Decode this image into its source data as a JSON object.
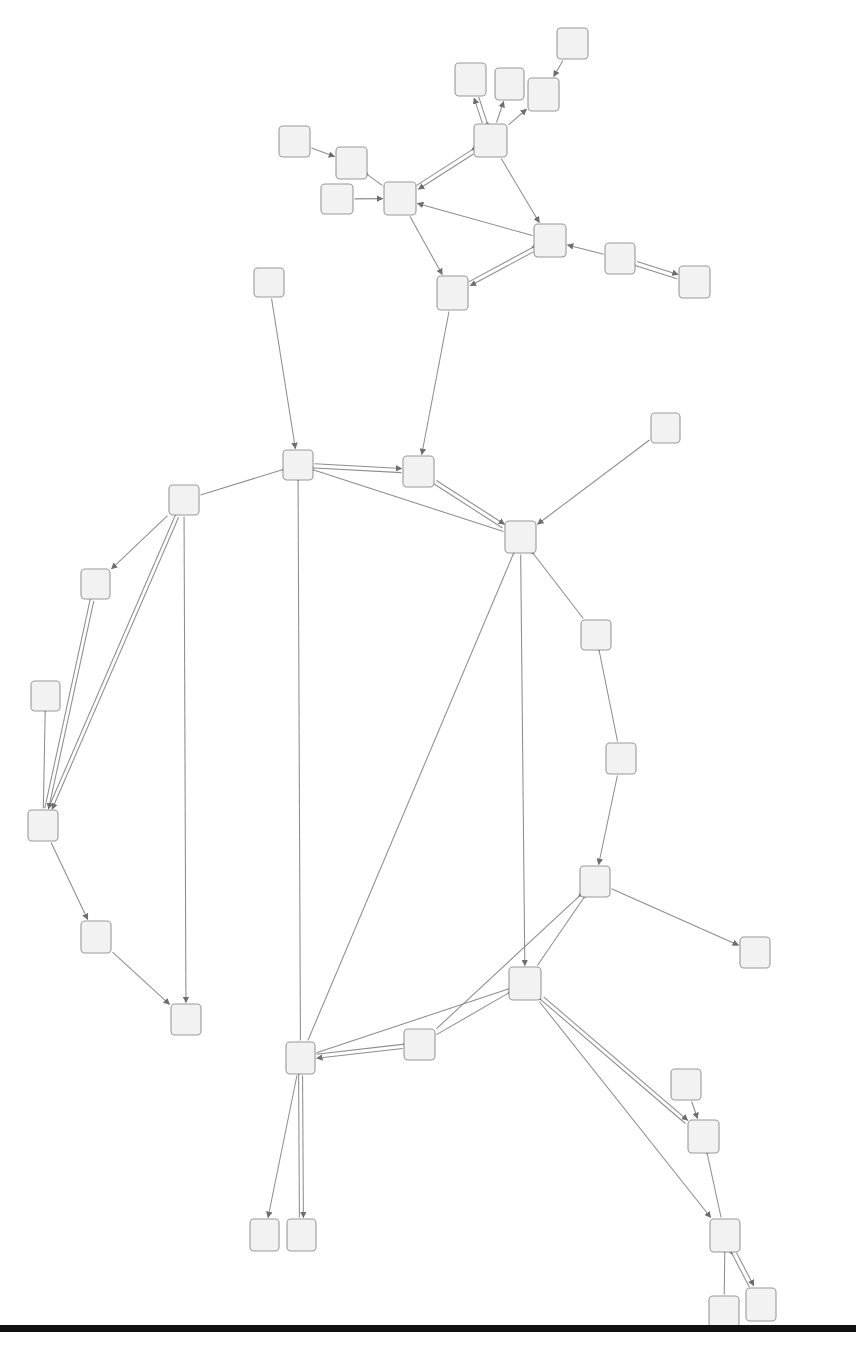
{
  "figure": {
    "kind": "directed-graph-diagram",
    "title": "",
    "caption": "",
    "width": 856,
    "height": 1356,
    "background_color": "#ffffff"
  },
  "style": {
    "node_fill": "#f2f2f2",
    "node_stroke": "#9a9a9a",
    "node_stroke_width": 1.1,
    "node_corner_radius": 4,
    "edge_color": "#8d8d8d",
    "edge_width": 1.05,
    "arrowhead_color": "#6e6e6e",
    "baseline_color": "#111111"
  },
  "baseline": {
    "label": "page-rule",
    "x": 0,
    "y": 1325,
    "width": 856,
    "height": 7
  },
  "graph_data": {
    "type": "node-link",
    "directed": true,
    "node_count": 41,
    "edge_count": 52,
    "node_label_text": "",
    "nodes": [
      {
        "id": "n1",
        "x": 557,
        "y": 28,
        "w": 31,
        "h": 31
      },
      {
        "id": "n2",
        "x": 455,
        "y": 63,
        "w": 31,
        "h": 33
      },
      {
        "id": "n3",
        "x": 495,
        "y": 68,
        "w": 29,
        "h": 32
      },
      {
        "id": "n4",
        "x": 528,
        "y": 78,
        "w": 31,
        "h": 33
      },
      {
        "id": "n5",
        "x": 474,
        "y": 124,
        "w": 33,
        "h": 33
      },
      {
        "id": "n6",
        "x": 279,
        "y": 126,
        "w": 31,
        "h": 31
      },
      {
        "id": "n7",
        "x": 336,
        "y": 147,
        "w": 31,
        "h": 32
      },
      {
        "id": "n8",
        "x": 321,
        "y": 184,
        "w": 32,
        "h": 30
      },
      {
        "id": "n9",
        "x": 384,
        "y": 182,
        "w": 32,
        "h": 33
      },
      {
        "id": "n10",
        "x": 534,
        "y": 224,
        "w": 32,
        "h": 33
      },
      {
        "id": "n11",
        "x": 605,
        "y": 243,
        "w": 30,
        "h": 31
      },
      {
        "id": "n12",
        "x": 679,
        "y": 266,
        "w": 31,
        "h": 32
      },
      {
        "id": "n13",
        "x": 437,
        "y": 276,
        "w": 31,
        "h": 34
      },
      {
        "id": "n14",
        "x": 254,
        "y": 268,
        "w": 30,
        "h": 29
      },
      {
        "id": "n15",
        "x": 651,
        "y": 413,
        "w": 29,
        "h": 30
      },
      {
        "id": "n16",
        "x": 283,
        "y": 450,
        "w": 30,
        "h": 30
      },
      {
        "id": "n17",
        "x": 403,
        "y": 456,
        "w": 31,
        "h": 31
      },
      {
        "id": "n18",
        "x": 169,
        "y": 485,
        "w": 30,
        "h": 30
      },
      {
        "id": "n19",
        "x": 505,
        "y": 521,
        "w": 31,
        "h": 32
      },
      {
        "id": "n20",
        "x": 81,
        "y": 569,
        "w": 29,
        "h": 30
      },
      {
        "id": "n21",
        "x": 581,
        "y": 620,
        "w": 30,
        "h": 30
      },
      {
        "id": "n22",
        "x": 31,
        "y": 681,
        "w": 29,
        "h": 30
      },
      {
        "id": "n23",
        "x": 606,
        "y": 743,
        "w": 30,
        "h": 31
      },
      {
        "id": "n24",
        "x": 28,
        "y": 810,
        "w": 30,
        "h": 31
      },
      {
        "id": "n25",
        "x": 580,
        "y": 866,
        "w": 30,
        "h": 31
      },
      {
        "id": "n26",
        "x": 81,
        "y": 921,
        "w": 30,
        "h": 32
      },
      {
        "id": "n27",
        "x": 740,
        "y": 937,
        "w": 30,
        "h": 31
      },
      {
        "id": "n28",
        "x": 509,
        "y": 967,
        "w": 32,
        "h": 33
      },
      {
        "id": "n29",
        "x": 171,
        "y": 1004,
        "w": 30,
        "h": 31
      },
      {
        "id": "n30",
        "x": 404,
        "y": 1029,
        "w": 31,
        "h": 31
      },
      {
        "id": "n31",
        "x": 286,
        "y": 1042,
        "w": 29,
        "h": 32
      },
      {
        "id": "n32",
        "x": 671,
        "y": 1069,
        "w": 30,
        "h": 31
      },
      {
        "id": "n33",
        "x": 688,
        "y": 1120,
        "w": 31,
        "h": 33
      },
      {
        "id": "n34",
        "x": 250,
        "y": 1219,
        "w": 29,
        "h": 32
      },
      {
        "id": "n35",
        "x": 287,
        "y": 1219,
        "w": 29,
        "h": 32
      },
      {
        "id": "n36",
        "x": 710,
        "y": 1219,
        "w": 30,
        "h": 33
      },
      {
        "id": "n37",
        "x": 746,
        "y": 1288,
        "w": 30,
        "h": 33
      },
      {
        "id": "n38",
        "x": 709,
        "y": 1296,
        "w": 30,
        "h": 32
      }
    ],
    "edges": [
      {
        "source": "n1",
        "target": "n4",
        "arrow": "forward"
      },
      {
        "source": "n5",
        "target": "n2",
        "arrow": "both"
      },
      {
        "source": "n5",
        "target": "n3",
        "arrow": "forward"
      },
      {
        "source": "n5",
        "target": "n4",
        "arrow": "forward"
      },
      {
        "source": "n5",
        "target": "n9",
        "arrow": "both"
      },
      {
        "source": "n5",
        "target": "n10",
        "arrow": "forward"
      },
      {
        "source": "n6",
        "target": "n7",
        "arrow": "forward"
      },
      {
        "source": "n7",
        "target": "n9",
        "arrow": "backward"
      },
      {
        "source": "n8",
        "target": "n9",
        "arrow": "forward"
      },
      {
        "source": "n9",
        "target": "n13",
        "arrow": "forward"
      },
      {
        "source": "n10",
        "target": "n9",
        "arrow": "forward"
      },
      {
        "source": "n10",
        "target": "n13",
        "arrow": "both"
      },
      {
        "source": "n11",
        "target": "n10",
        "arrow": "forward"
      },
      {
        "source": "n11",
        "target": "n12",
        "arrow": "both"
      },
      {
        "source": "n13",
        "target": "n17",
        "arrow": "forward"
      },
      {
        "source": "n14",
        "target": "n16",
        "arrow": "forward"
      },
      {
        "source": "n15",
        "target": "n19",
        "arrow": "forward"
      },
      {
        "source": "n16",
        "target": "n17",
        "arrow": "both"
      },
      {
        "source": "n16",
        "target": "n18",
        "arrow": "backward"
      },
      {
        "source": "n16",
        "target": "n19",
        "arrow": "backward"
      },
      {
        "source": "n16",
        "target": "n31",
        "arrow": "backward"
      },
      {
        "source": "n17",
        "target": "n19",
        "arrow": "both"
      },
      {
        "source": "n18",
        "target": "n20",
        "arrow": "forward"
      },
      {
        "source": "n18",
        "target": "n24",
        "arrow": "both"
      },
      {
        "source": "n18",
        "target": "n29",
        "arrow": "forward"
      },
      {
        "source": "n19",
        "target": "n21",
        "arrow": "backward"
      },
      {
        "source": "n19",
        "target": "n28",
        "arrow": "forward"
      },
      {
        "source": "n19",
        "target": "n31",
        "arrow": "backward"
      },
      {
        "source": "n20",
        "target": "n24",
        "arrow": "both"
      },
      {
        "source": "n21",
        "target": "n23",
        "arrow": "backward"
      },
      {
        "source": "n22",
        "target": "n24",
        "arrow": "backward"
      },
      {
        "source": "n23",
        "target": "n25",
        "arrow": "forward"
      },
      {
        "source": "n24",
        "target": "n26",
        "arrow": "forward"
      },
      {
        "source": "n25",
        "target": "n27",
        "arrow": "forward"
      },
      {
        "source": "n25",
        "target": "n28",
        "arrow": "backward"
      },
      {
        "source": "n25",
        "target": "n30",
        "arrow": "backward"
      },
      {
        "source": "n26",
        "target": "n29",
        "arrow": "forward"
      },
      {
        "source": "n28",
        "target": "n30",
        "arrow": "backward"
      },
      {
        "source": "n28",
        "target": "n31",
        "arrow": "backward"
      },
      {
        "source": "n28",
        "target": "n33",
        "arrow": "both"
      },
      {
        "source": "n28",
        "target": "n36",
        "arrow": "forward"
      },
      {
        "source": "n30",
        "target": "n31",
        "arrow": "both"
      },
      {
        "source": "n31",
        "target": "n34",
        "arrow": "forward"
      },
      {
        "source": "n31",
        "target": "n35",
        "arrow": "both"
      },
      {
        "source": "n32",
        "target": "n33",
        "arrow": "forward"
      },
      {
        "source": "n33",
        "target": "n36",
        "arrow": "backward"
      },
      {
        "source": "n36",
        "target": "n37",
        "arrow": "both"
      },
      {
        "source": "n36",
        "target": "n38",
        "arrow": "backward"
      }
    ]
  }
}
